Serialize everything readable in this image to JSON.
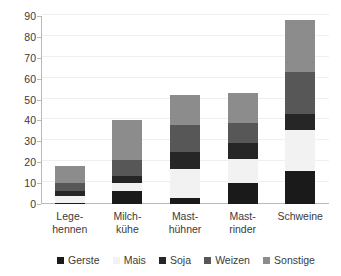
{
  "chart_data": {
    "type": "bar",
    "subtype": "stacked-bar",
    "title": "",
    "xlabel": "",
    "ylabel": "",
    "ylim": [
      0,
      90
    ],
    "ytick_step": 10,
    "yticks": [
      0,
      10,
      20,
      30,
      40,
      50,
      60,
      70,
      80,
      90
    ],
    "ytick_labels": [
      "0",
      "10",
      "20",
      "30",
      "40",
      "50",
      "60",
      "70",
      "80",
      "90"
    ],
    "grid": true,
    "grid_axis": "y",
    "legend_position": "bottom",
    "categories": [
      "Lege-hennen",
      "Milch-kühe",
      "Mast-hühner",
      "Mast-rinder",
      "Schweine"
    ],
    "category_lines": [
      [
        "Lege-",
        "hennen"
      ],
      [
        "Milch-",
        "kühe"
      ],
      [
        "Mast-",
        "hühner"
      ],
      [
        "Mast-",
        "rinder"
      ],
      [
        "Schweine"
      ]
    ],
    "series": [
      {
        "name": "Gerste",
        "color": "#1a1a1a",
        "values": [
          0.5,
          6.0,
          3.0,
          10.0,
          16.0
        ]
      },
      {
        "name": "Mais",
        "color": "#f2f2f2",
        "values": [
          3.5,
          4.0,
          14.0,
          11.5,
          19.5
        ]
      },
      {
        "name": "Soja",
        "color": "#262626",
        "values": [
          2.0,
          3.5,
          8.0,
          7.5,
          7.5
        ]
      },
      {
        "name": "Weizen",
        "color": "#575757",
        "values": [
          4.0,
          7.5,
          13.0,
          10.0,
          20.0
        ]
      },
      {
        "name": "Sonstige",
        "color": "#8c8c8c",
        "values": [
          8.0,
          19.0,
          14.0,
          14.0,
          25.0
        ]
      }
    ],
    "totals": [
      18,
      40,
      52,
      53,
      88
    ]
  },
  "legend": {
    "items": [
      {
        "label": "Gerste",
        "color": "#1a1a1a"
      },
      {
        "label": "Mais",
        "color": "#f2f2f2"
      },
      {
        "label": "Soja",
        "color": "#262626"
      },
      {
        "label": "Weizen",
        "color": "#575757"
      },
      {
        "label": "Sonstige",
        "color": "#8c8c8c"
      }
    ]
  },
  "colors": {
    "background": "#ffffff",
    "axis": "#b9b9b9",
    "gridline": "#efefef",
    "text": "#3a3a3a"
  }
}
